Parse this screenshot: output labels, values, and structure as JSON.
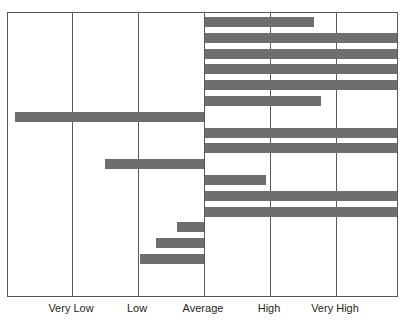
{
  "chart_data": {
    "type": "bar",
    "orientation": "horizontal",
    "title": "",
    "xlabel": "",
    "ylabel": "",
    "grid": true,
    "legend": null,
    "bar_color": "#6e6e6e",
    "frame_color": "#59595c",
    "background": "#ffffff",
    "baseline_category": "Average",
    "baseline_value": 0,
    "xlim": [
      -3.0,
      3.0
    ],
    "tick_labels": [
      "Very Low",
      "Low",
      "Average",
      "High",
      "Very High"
    ],
    "tick_values": [
      -2,
      -1,
      0,
      1,
      2
    ],
    "gridline_values": [
      -3,
      -2,
      -1,
      0,
      1,
      2,
      3
    ],
    "categories": [
      "item-1",
      "item-2",
      "item-3",
      "item-4",
      "item-5",
      "item-6",
      "item-7",
      "item-8",
      "item-9",
      "item-10",
      "item-11",
      "item-12",
      "item-13",
      "item-14",
      "item-15",
      "item-16"
    ],
    "values": [
      1.67,
      2.95,
      2.95,
      2.95,
      2.95,
      1.77,
      -2.86,
      2.95,
      2.95,
      -1.5,
      0.94,
      2.95,
      2.95,
      -0.41,
      -0.73,
      -0.97
    ],
    "bars": [
      {
        "name": "bar-1",
        "value": 1.67,
        "direction": "right",
        "clipped": false
      },
      {
        "name": "bar-2",
        "value": 2.95,
        "direction": "right",
        "clipped": true
      },
      {
        "name": "bar-3",
        "value": 2.95,
        "direction": "right",
        "clipped": true
      },
      {
        "name": "bar-4",
        "value": 2.95,
        "direction": "right",
        "clipped": true
      },
      {
        "name": "bar-5",
        "value": 2.95,
        "direction": "right",
        "clipped": true
      },
      {
        "name": "bar-6",
        "value": 1.77,
        "direction": "right",
        "clipped": false
      },
      {
        "name": "bar-7",
        "value": -2.86,
        "direction": "left",
        "clipped": false
      },
      {
        "name": "bar-8",
        "value": 2.95,
        "direction": "right",
        "clipped": true
      },
      {
        "name": "bar-9",
        "value": 2.95,
        "direction": "right",
        "clipped": true
      },
      {
        "name": "bar-10",
        "value": -1.5,
        "direction": "left",
        "clipped": false
      },
      {
        "name": "bar-11",
        "value": 0.94,
        "direction": "right",
        "clipped": false
      },
      {
        "name": "bar-12",
        "value": 2.95,
        "direction": "right",
        "clipped": true
      },
      {
        "name": "bar-13",
        "value": 2.95,
        "direction": "right",
        "clipped": true
      },
      {
        "name": "bar-14",
        "value": -0.41,
        "direction": "left",
        "clipped": false
      },
      {
        "name": "bar-15",
        "value": -0.73,
        "direction": "left",
        "clipped": false
      },
      {
        "name": "bar-16",
        "value": -0.97,
        "direction": "left",
        "clipped": false
      }
    ]
  },
  "layout": {
    "plot": {
      "x": 7,
      "y": 12,
      "width": 391,
      "height": 285
    },
    "pixels_per_unit": 66,
    "baseline_x_in_plot": 196,
    "row_pitch": 15.8,
    "row_first_top": 4,
    "bar_height": 10
  }
}
